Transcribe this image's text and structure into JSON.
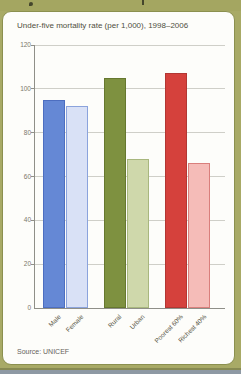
{
  "header": {
    "title": "Under-five mortality rate (per 1,000), 1998–2006"
  },
  "source_label": "Source: UNICEF",
  "chart_data": {
    "type": "bar",
    "title": "Under-five mortality rate (per 1,000), 1998–2006",
    "categories": [
      "Male",
      "Female",
      "Rural",
      "Urban",
      "Poorest 60%",
      "Richest 40%"
    ],
    "values": [
      95,
      92,
      105,
      68,
      107,
      66
    ],
    "bar_colors": [
      "#6588d5",
      "#d9e1f6",
      "#7e9140",
      "#cfd8ab",
      "#d5413c",
      "#f5bcb8"
    ],
    "bar_border_colors": [
      "#4d6ec0",
      "#8ba3dc",
      "#66782f",
      "#a8b77e",
      "#b23733",
      "#d97f7c"
    ],
    "xlabel": "",
    "ylabel": "",
    "ylim": [
      0,
      120
    ],
    "yticks": [
      0,
      20,
      40,
      60,
      80,
      100,
      120
    ],
    "grid": true,
    "legend": false,
    "grouping": "pairs",
    "source": "Source: UNICEF"
  },
  "colors": {
    "frame_olive": "#a8aa66",
    "card_background": "#fdfdfa",
    "card_border": "#8b904f",
    "gridline": "#cfcfc8",
    "axis": "#8f8f88",
    "page_edge": "#8e99a4"
  }
}
